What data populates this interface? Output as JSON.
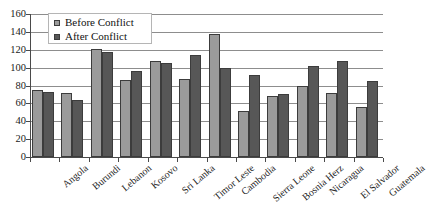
{
  "chart_data": {
    "type": "bar",
    "title": "",
    "subtitle": "",
    "xlabel": "",
    "ylabel": "",
    "ylim": [
      0,
      160
    ],
    "yticks": [
      0,
      20,
      40,
      60,
      80,
      100,
      120,
      140,
      160
    ],
    "grid": true,
    "legend_position": "top-left",
    "categories": [
      "Angola",
      "Burundi",
      "Lebanon",
      "Kosovo",
      "Sri Lanka",
      "Timor Leste",
      "Cambodia",
      "Sierra Leone",
      "Bosnia Herz",
      "Nicaragua",
      "El Salvador",
      "Guatemala"
    ],
    "series": [
      {
        "name": "Before Conflict",
        "color": "#9b9b9b",
        "values": [
          75,
          72,
          121,
          86,
          107,
          87,
          138,
          51,
          68,
          79,
          72,
          56
        ]
      },
      {
        "name": "After Conflict",
        "color": "#575757",
        "values": [
          73,
          64,
          117,
          96,
          105,
          114,
          100,
          92,
          71,
          102,
          107,
          85
        ]
      }
    ]
  },
  "legend": {
    "items": [
      {
        "label": "Before Conflict",
        "swatch": "before"
      },
      {
        "label": "After Conflict",
        "swatch": "after"
      }
    ]
  }
}
